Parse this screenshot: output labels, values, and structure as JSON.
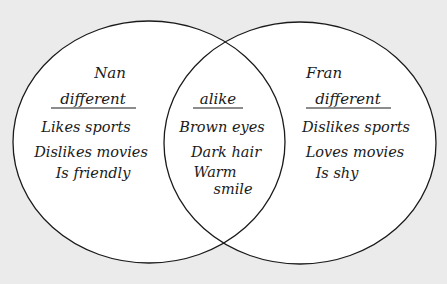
{
  "diagram": {
    "type": "venn",
    "colors": {
      "background": "#ebebeb",
      "circle_fill": "#ffffff",
      "stroke": "#1a1a1a"
    },
    "left": {
      "name": "Nan",
      "heading": "different",
      "items": [
        "Likes sports",
        "Dislikes movies",
        "Is friendly"
      ]
    },
    "overlap": {
      "heading": "alike",
      "items": [
        "Brown eyes",
        "Dark hair",
        "Warm",
        "smile"
      ]
    },
    "right": {
      "name": "Fran",
      "heading": "different",
      "items": [
        "Dislikes sports",
        "Loves movies",
        "Is shy"
      ]
    }
  }
}
